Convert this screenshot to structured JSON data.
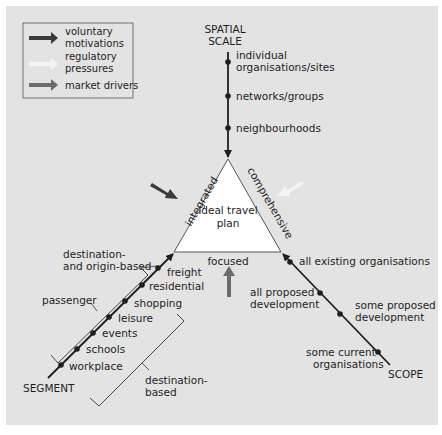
{
  "legend": {
    "items": [
      {
        "label_lines": [
          "voluntary",
          "motivations"
        ],
        "color": "#3a3a3a"
      },
      {
        "label_lines": [
          "regulatory",
          "pressures"
        ],
        "color": "#f4f4f4"
      },
      {
        "label_lines": [
          "market drivers"
        ],
        "color": "#6b6b6b"
      }
    ]
  },
  "center": {
    "label_lines": [
      "ideal travel",
      "plan"
    ],
    "sides": {
      "left": "integrated",
      "right": "comprehensive",
      "bottom": "focused"
    }
  },
  "axes": {
    "spatial_scale": {
      "title_lines": [
        "SPATIAL",
        "SCALE"
      ],
      "points": [
        {
          "label_lines": [
            "individual",
            "organisations/sites"
          ]
        },
        {
          "label_lines": [
            "networks/groups"
          ]
        },
        {
          "label_lines": [
            "neighbourhoods"
          ]
        }
      ]
    },
    "segment": {
      "title": "SEGMENT",
      "points": [
        "freight",
        "residential",
        "shopping",
        "leisure",
        "events",
        "schools",
        "workplace"
      ],
      "annotations": {
        "dest_origin_lines": [
          "destination-",
          "and origin-based"
        ],
        "passenger": "passenger",
        "destination_based_lines": [
          "destination-",
          "based"
        ]
      }
    },
    "scope": {
      "title": "SCOPE",
      "points": [
        {
          "label_lines": [
            "all existing organisations"
          ]
        },
        {
          "label_lines": [
            "all proposed",
            "development"
          ]
        },
        {
          "label_lines": [
            "some proposed",
            "development"
          ]
        },
        {
          "label_lines": [
            "some current",
            "organisations"
          ]
        }
      ]
    }
  },
  "colors": {
    "panel": "#e3e3e3",
    "dark_arrow": "#3a3a3a",
    "light_arrow": "#f4f4f4",
    "mid_arrow": "#6b6b6b"
  }
}
